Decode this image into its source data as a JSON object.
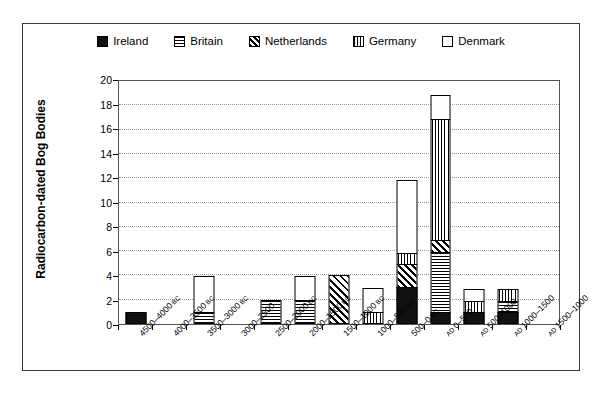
{
  "chart_data": {
    "type": "bar",
    "subtype": "stacked-bar",
    "title": "",
    "xlabel": "",
    "ylabel": "Radiocarbon-dated Bog Bodies",
    "ylim": [
      0,
      20
    ],
    "ytick_step": 2,
    "yticks": [
      0,
      2,
      4,
      6,
      8,
      10,
      12,
      14,
      16,
      18,
      20
    ],
    "grid": "horizontal-dotted",
    "legend_position": "top-center",
    "categories": [
      "4500–4000 BC",
      "4000–3500 BC",
      "3500–3000 BC",
      "3000–2500",
      "2500–2000 BC",
      "2000–1500 BC",
      "1500–1000 BC",
      "1000–500 BC",
      "500–0 BC",
      "AD 0–500",
      "AD 500–1000",
      "AD 1000–1500",
      "AD 1500–1000"
    ],
    "series": [
      {
        "name": "Ireland",
        "pattern": "solid-black",
        "values": [
          1,
          0,
          0,
          0,
          0,
          0,
          0,
          0,
          3,
          1,
          1,
          1,
          0
        ]
      },
      {
        "name": "Britain",
        "pattern": "horizontal-lines",
        "values": [
          0,
          0,
          1,
          0,
          2,
          2,
          0,
          0,
          0,
          5,
          0,
          1,
          0
        ]
      },
      {
        "name": "Netherlands",
        "pattern": "diagonal-lines",
        "values": [
          0,
          0,
          0,
          0,
          0,
          0,
          4,
          0,
          2,
          1,
          0,
          0,
          0
        ]
      },
      {
        "name": "Germany",
        "pattern": "vertical-lines",
        "values": [
          0,
          0,
          0,
          0,
          0,
          0,
          0,
          1,
          1,
          10,
          1,
          1,
          0
        ]
      },
      {
        "name": "Denmark",
        "pattern": "empty-white",
        "values": [
          0,
          0,
          3,
          0,
          0,
          2,
          0,
          2,
          6,
          2,
          1,
          0,
          0
        ]
      }
    ],
    "totals": [
      1,
      0,
      4,
      0,
      2,
      4,
      4,
      3,
      12,
      19,
      3,
      3,
      0
    ]
  },
  "legend": {
    "items": [
      {
        "label": "Ireland",
        "pattern": "solid-black"
      },
      {
        "label": "Britain",
        "pattern": "horizontal-lines"
      },
      {
        "label": "Netherlands",
        "pattern": "diagonal-lines"
      },
      {
        "label": "Germany",
        "pattern": "vertical-lines"
      },
      {
        "label": "Denmark",
        "pattern": "empty-white"
      }
    ]
  },
  "colors": {
    "ink": "#000000",
    "gridline": "#9a9a9a",
    "frame": "#3a3a3a",
    "background": "#ffffff"
  }
}
